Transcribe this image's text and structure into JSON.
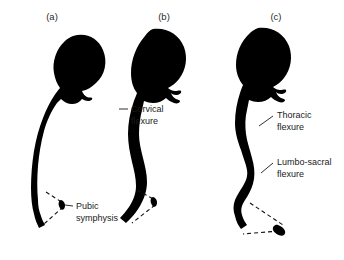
{
  "figure": {
    "background_color": "#ffffff",
    "ink_color": "#000000",
    "panels": [
      {
        "id": "a",
        "label": "(a)",
        "label_x": 52,
        "label_y": 20,
        "description": "Fetal / newborn posture with single primary curvature and forward-tilted head"
      },
      {
        "id": "b",
        "label": "(b)",
        "label_x": 164,
        "label_y": 20,
        "description": "Infant posture with cervical flexure developed, head held upright"
      },
      {
        "id": "c",
        "label": "(c)",
        "label_x": 276,
        "label_y": 20,
        "description": "Toddler posture with thoracic and lumbo-sacral flexures developed"
      }
    ],
    "annotations": [
      {
        "id": "pubic-symphysis",
        "lines": [
          "Pubic",
          "symphysis"
        ],
        "text_x": 76,
        "text_y": 209,
        "panel": "a",
        "leader": "M 71 206 L 64 205"
      },
      {
        "id": "cervical-flexure",
        "lines": [
          "Cervical",
          "flexure"
        ],
        "text_x": 131,
        "text_y": 112,
        "panel": "b",
        "leader": "M 128 109 L 119 109"
      },
      {
        "id": "thoracic-flexure",
        "lines": [
          "Thoracic",
          "flexure"
        ],
        "text_x": 277,
        "text_y": 118,
        "panel": "c",
        "leader": "M 273 116 L 259 126"
      },
      {
        "id": "lumbo-sacral-flexure",
        "lines": [
          "Lumbo-sacral",
          "flexure"
        ],
        "text_x": 277,
        "text_y": 165,
        "panel": "c",
        "leader": "M 273 163 L 261 173"
      }
    ]
  }
}
